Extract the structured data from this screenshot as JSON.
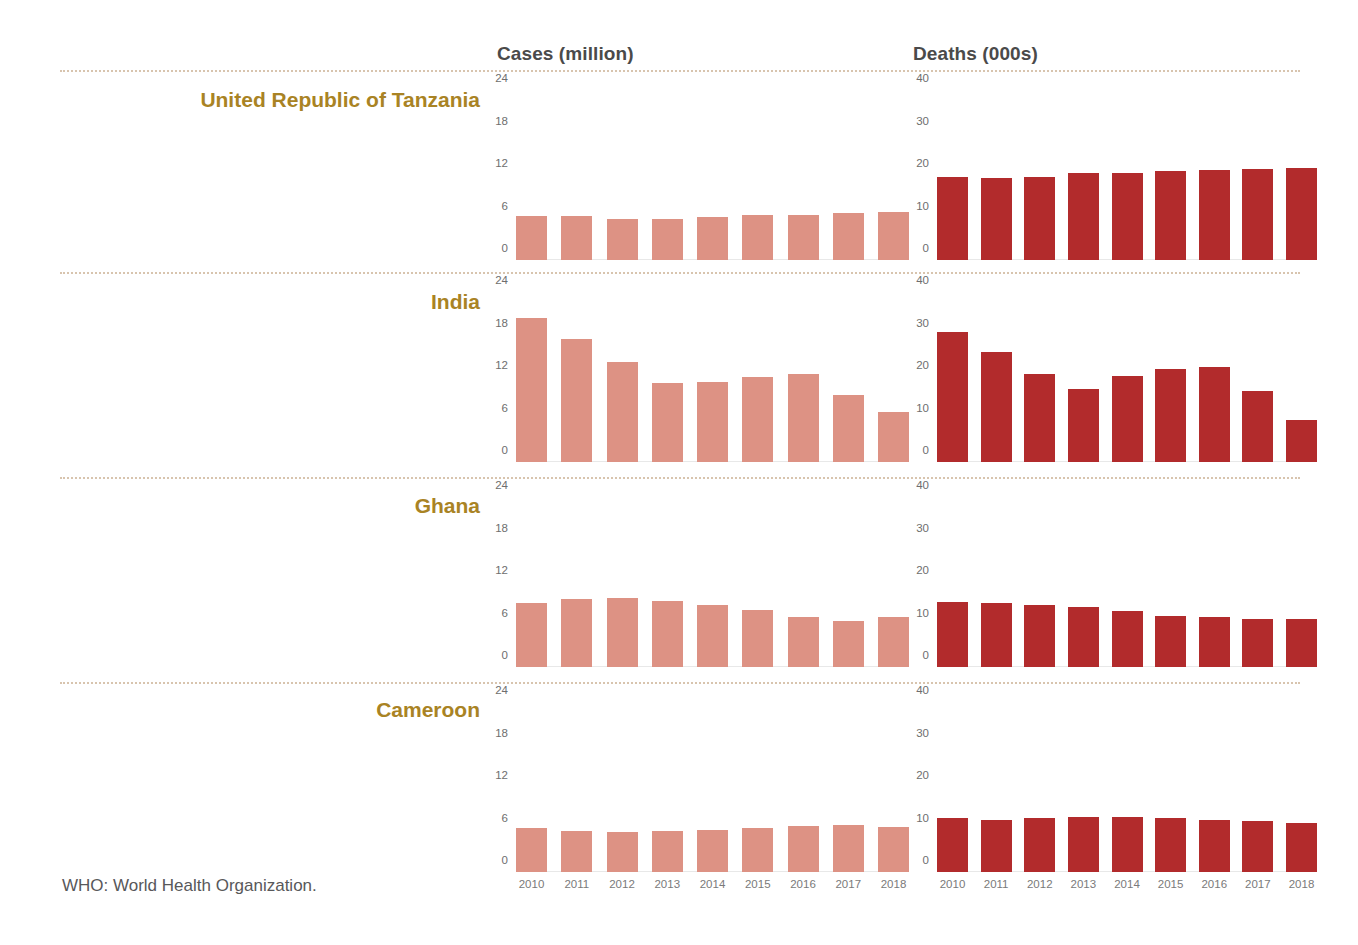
{
  "headers": {
    "cases": "Cases (million)",
    "deaths": "Deaths (000s)"
  },
  "footnote": "WHO: World Health Organization.",
  "colors": {
    "cases_bar": "#dd9284",
    "deaths_bar": "#b22b2c",
    "country_label": "#a98324",
    "separator": "#d8c4ae",
    "header_text": "#4a4a4a",
    "tick_text": "#6e6e6e"
  },
  "panels": [
    {
      "country": "United Republic of Tanzania"
    },
    {
      "country": "India"
    },
    {
      "country": "Ghana"
    },
    {
      "country": "Cameroon"
    }
  ],
  "chart_data": {
    "type": "bar",
    "title": "",
    "xlabel": "",
    "grid": false,
    "legend": false,
    "x": [
      "2010",
      "2011",
      "2012",
      "2013",
      "2014",
      "2015",
      "2016",
      "2017",
      "2018"
    ],
    "panels": [
      {
        "country": "United Republic of Tanzania",
        "cases": {
          "ylabel": "Cases (million)",
          "ylim": [
            0,
            24
          ],
          "yticks": [
            0,
            6,
            12,
            18,
            24
          ],
          "values": [
            6.2,
            6.2,
            5.8,
            5.8,
            6.1,
            6.3,
            6.4,
            6.7,
            6.8
          ]
        },
        "deaths": {
          "ylabel": "Deaths (000s)",
          "ylim": [
            0,
            40
          ],
          "yticks": [
            0,
            10,
            20,
            30,
            40
          ],
          "values": [
            19.6,
            19.4,
            19.5,
            20.4,
            20.5,
            21.0,
            21.1,
            21.3,
            21.6
          ]
        }
      },
      {
        "country": "India",
        "cases": {
          "ylabel": "Cases (million)",
          "ylim": [
            0,
            24
          ],
          "yticks": [
            0,
            6,
            12,
            18,
            24
          ],
          "values": [
            20.3,
            17.4,
            14.1,
            11.2,
            11.3,
            12.0,
            12.4,
            9.5,
            7.0
          ]
        },
        "deaths": {
          "ylabel": "Deaths (000s)",
          "ylim": [
            0,
            40
          ],
          "yticks": [
            0,
            10,
            20,
            30,
            40
          ],
          "values": [
            30.6,
            25.9,
            20.7,
            17.1,
            20.3,
            21.8,
            22.4,
            16.6,
            9.9
          ]
        }
      },
      {
        "country": "Ghana",
        "cases": {
          "ylabel": "Cases (million)",
          "ylim": [
            0,
            24
          ],
          "yticks": [
            0,
            6,
            12,
            18,
            24
          ],
          "values": [
            9.1,
            9.6,
            9.7,
            9.3,
            8.8,
            8.0,
            7.0,
            6.5,
            7.0
          ]
        },
        "deaths": {
          "ylabel": "Deaths (000s)",
          "ylim": [
            0,
            40
          ],
          "yticks": [
            0,
            10,
            20,
            30,
            40
          ],
          "values": [
            15.3,
            15.1,
            14.7,
            14.2,
            13.2,
            12.1,
            11.7,
            11.4,
            11.4
          ]
        }
      },
      {
        "country": "Cameroon",
        "cases": {
          "ylabel": "Cases (million)",
          "ylim": [
            0,
            24
          ],
          "yticks": [
            0,
            6,
            12,
            18,
            24
          ],
          "values": [
            6.2,
            5.8,
            5.7,
            5.8,
            5.9,
            6.2,
            6.5,
            6.6,
            6.3
          ]
        },
        "deaths": {
          "ylabel": "Deaths (000s)",
          "ylim": [
            0,
            40
          ],
          "yticks": [
            0,
            10,
            20,
            30,
            40
          ],
          "values": [
            12.8,
            12.3,
            12.7,
            12.9,
            13.0,
            12.6,
            12.2,
            11.9,
            11.5
          ]
        }
      }
    ]
  }
}
